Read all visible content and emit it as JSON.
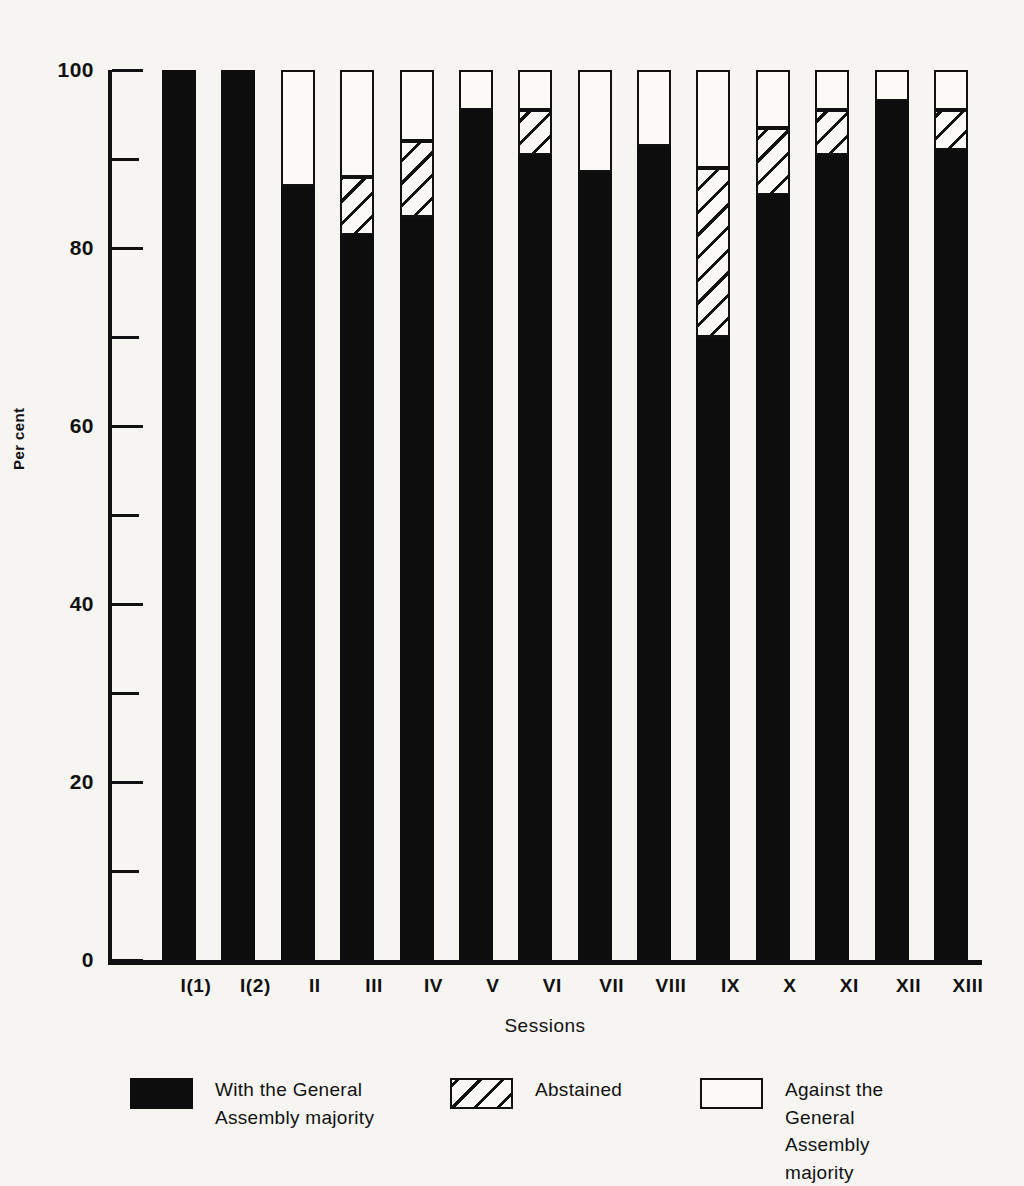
{
  "chart_data": {
    "type": "bar",
    "subtype": "stacked-bar-100",
    "title": "",
    "xlabel": "Sessions",
    "ylabel": "Per cent",
    "ylim": [
      0,
      100
    ],
    "grid": false,
    "legend_position": "bottom",
    "y_ticks_major": [
      "0",
      "20",
      "40",
      "60",
      "80",
      "100"
    ],
    "y_ticks_minor": [
      10,
      30,
      50,
      70,
      90
    ],
    "categories": [
      "I(1)",
      "I(2)",
      "II",
      "III",
      "IV",
      "V",
      "VI",
      "VII",
      "VIII",
      "IX",
      "X",
      "XI",
      "XII",
      "XIII"
    ],
    "series": [
      {
        "name": "With the General Assembly majority",
        "key": "with",
        "color": "#0d0d0d",
        "pattern": "solid",
        "values": [
          100,
          100,
          87,
          81.5,
          83.5,
          95.5,
          90.5,
          88.5,
          91.5,
          70,
          86,
          90.5,
          96.5,
          91
        ]
      },
      {
        "name": "Abstained",
        "key": "abstained",
        "color": "#fbfaf7",
        "pattern": "diagonal-hatch",
        "values": [
          0,
          0,
          0,
          6.5,
          8.5,
          0,
          5,
          0,
          0,
          19,
          7.5,
          5,
          0,
          4.5
        ]
      },
      {
        "name": "Against the General Assembly majority",
        "key": "against",
        "color": "#fbfaf7",
        "pattern": "open",
        "values": [
          0,
          0,
          13,
          12,
          8,
          4.5,
          4.5,
          11.5,
          8.5,
          11,
          6.5,
          4.5,
          3.5,
          4.5
        ]
      }
    ]
  },
  "axes": {
    "y_title": "Per cent",
    "x_title": "Sessions"
  },
  "legend": {
    "items": [
      {
        "swatch": "solid-black-swatch",
        "label": "With the General\nAssembly majority"
      },
      {
        "swatch": "hatched-swatch",
        "label": "Abstained"
      },
      {
        "swatch": "open-white-swatch",
        "label": "Against the General\nAssembly majority"
      }
    ]
  },
  "colors": {
    "ink": "#111111",
    "paper": "#f6f5f1",
    "bar_fill": "#0d0d0d",
    "bar_open": "#fbfaf7"
  }
}
